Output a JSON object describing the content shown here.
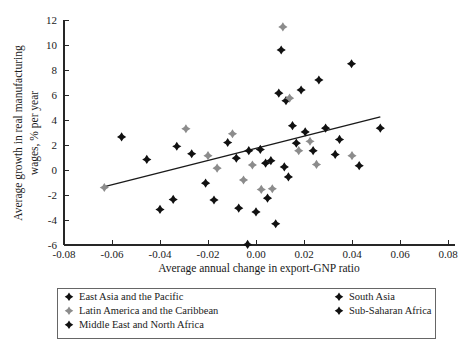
{
  "chart_data": {
    "type": "scatter",
    "title": "",
    "xlabel": "Average annual change in export-GNP ratio",
    "ylabel": "Average growth in real manufacturing wages, % per year",
    "xlim": [
      -0.085,
      0.082
    ],
    "ylim": [
      -6,
      12
    ],
    "xticks": [
      -0.08,
      -0.06,
      -0.04,
      -0.02,
      0.0,
      0.02,
      0.04,
      0.06,
      0.08
    ],
    "xtick_labels": [
      "-0.08",
      "-0.06",
      "-0.04",
      "-0.02",
      "0.00",
      "0.02",
      "0.04",
      "0.06",
      "0.08"
    ],
    "yticks": [
      -6,
      -4,
      -2,
      0,
      2,
      4,
      6,
      8,
      10,
      12
    ],
    "ytick_labels": [
      "-6",
      "-4",
      "-2",
      "0",
      "2",
      "4",
      "6",
      "8",
      "10",
      "12"
    ],
    "grid": false,
    "legend_position": "below-axes",
    "colors": {
      "dark": "#111111",
      "gray": "#8c8c8c",
      "trend": "#1a1a1a",
      "axis": "#262626"
    },
    "trend_line": {
      "label": "fitted regression line",
      "x_start": -0.0635,
      "y_start": -1.35,
      "x_end": 0.0518,
      "y_end": 4.25
    },
    "series": [
      {
        "name": "East Asia and the Pacific",
        "marker": "diamond",
        "color": "#111111",
        "points": [
          [
            -0.056,
            2.65
          ],
          [
            -0.0455,
            0.85
          ],
          [
            -0.033,
            1.9
          ],
          [
            -0.0268,
            1.3
          ],
          [
            -0.021,
            -1.05
          ],
          [
            -0.0175,
            -2.4
          ],
          [
            -0.0082,
            0.95
          ],
          [
            0.004,
            0.55
          ],
          [
            0.0105,
            9.6
          ],
          [
            0.0125,
            5.55
          ],
          [
            0.0152,
            3.55
          ],
          [
            0.0168,
            2.15
          ]
        ]
      },
      {
        "name": "Latin America and the Caribbean",
        "marker": "diamond",
        "color": "#8c8c8c",
        "points": [
          [
            -0.0632,
            -1.4
          ],
          [
            -0.0292,
            3.3
          ],
          [
            -0.02,
            1.15
          ],
          [
            -0.0162,
            0.15
          ],
          [
            -0.0098,
            2.9
          ],
          [
            -0.0052,
            -0.8
          ],
          [
            -0.0015,
            0.4
          ],
          [
            0.0022,
            -1.55
          ],
          [
            0.0068,
            -1.5
          ],
          [
            0.0112,
            11.45
          ],
          [
            0.014,
            5.75
          ],
          [
            0.0178,
            1.55
          ],
          [
            0.0225,
            2.3
          ],
          [
            0.0252,
            0.45
          ],
          [
            0.04,
            1.15
          ]
        ]
      },
      {
        "name": "Middle East and North Africa",
        "marker": "diamond",
        "color": "#111111",
        "points": [
          [
            -0.04,
            -3.15
          ],
          [
            -0.0345,
            -2.35
          ],
          [
            -0.0118,
            2.2
          ],
          [
            -0.0072,
            -3.05
          ],
          [
            -0.0035,
            -5.95
          ],
          [
            0.0,
            -3.35
          ],
          [
            0.0048,
            -2.25
          ],
          [
            0.0082,
            -4.3
          ]
        ]
      },
      {
        "name": "South Asia",
        "marker": "diamond",
        "color": "#111111",
        "points": [
          [
            -0.003,
            1.55
          ],
          [
            0.0018,
            1.65
          ],
          [
            0.0095,
            6.15
          ],
          [
            0.0188,
            6.4
          ],
          [
            0.0205,
            3.05
          ],
          [
            0.0238,
            1.55
          ]
        ]
      },
      {
        "name": "Sub-Saharan Africa",
        "marker": "diamond",
        "color": "#111111",
        "points": [
          [
            0.0062,
            0.75
          ],
          [
            0.0118,
            0.25
          ],
          [
            0.0135,
            -0.55
          ],
          [
            0.0262,
            7.2
          ],
          [
            0.029,
            3.35
          ],
          [
            0.033,
            1.25
          ],
          [
            0.0348,
            2.45
          ],
          [
            0.0398,
            8.5
          ],
          [
            0.043,
            0.35
          ],
          [
            0.0518,
            3.35
          ]
        ]
      }
    ]
  },
  "axes": {
    "x_title": "Average annual change in export-GNP ratio",
    "y_title_line1": "Average growth in real manufacturing",
    "y_title_line2": "wages, % per year"
  },
  "legend": {
    "column_left": [
      {
        "label": "East Asia and the Pacific",
        "color": "#111111"
      },
      {
        "label": "Latin America and the Caribbean",
        "color": "#8c8c8c"
      },
      {
        "label": "Middle East and North Africa",
        "color": "#111111"
      }
    ],
    "column_right": [
      {
        "label": "South Asia",
        "color": "#111111"
      },
      {
        "label": "Sub-Saharan Africa",
        "color": "#111111"
      }
    ]
  }
}
